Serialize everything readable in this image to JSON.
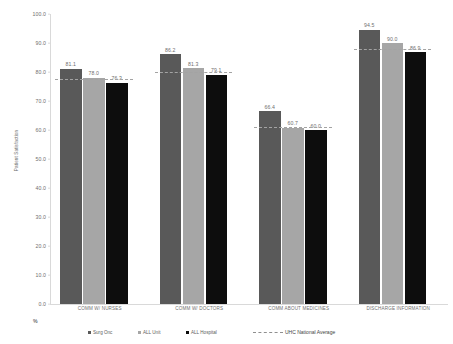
{
  "chart_data": {
    "type": "bar",
    "title": "",
    "xlabel": "",
    "ylabel": "Patient Satisfaction",
    "ylim": [
      0.0,
      100.0
    ],
    "yticks": [
      "0.0",
      "10.0",
      "20.0",
      "30.0",
      "40.0",
      "50.0",
      "60.0",
      "70.0",
      "80.0",
      "90.0",
      "100.0"
    ],
    "ytick_values": [
      0,
      10,
      20,
      30,
      40,
      50,
      60,
      70,
      80,
      90,
      100
    ],
    "grid": false,
    "legend_position": "bottom",
    "unit_marker": "%",
    "categories": [
      "COMM W/ NURSES",
      "COMM W/ DOCTORS",
      "COMM ABOUT MEDICINES",
      "DISCHARGE INFORMATION"
    ],
    "series": [
      {
        "name": "Surg Onc",
        "color": "#595959",
        "values": [
          81.1,
          86.2,
          66.4,
          94.5
        ],
        "labels": [
          "81.1",
          "86.2",
          "66.4",
          "94.5"
        ]
      },
      {
        "name": "ALL Unit",
        "color": "#a6a6a6",
        "values": [
          78.0,
          81.3,
          60.7,
          90.0
        ],
        "labels": [
          "78.0",
          "81.3",
          "60.7",
          "90.0"
        ]
      },
      {
        "name": "ALL Hospital",
        "color": "#0d0d0d",
        "values": [
          76.3,
          79.1,
          60.0,
          86.9
        ],
        "labels": [
          "76.3",
          "79.1",
          "60.0",
          "86.9"
        ]
      }
    ],
    "reference_line": {
      "name": "UHC National Average",
      "style": "dashed",
      "color": "#a3a3a3",
      "values": [
        77.2,
        79.7,
        60.6,
        87.5
      ]
    }
  }
}
